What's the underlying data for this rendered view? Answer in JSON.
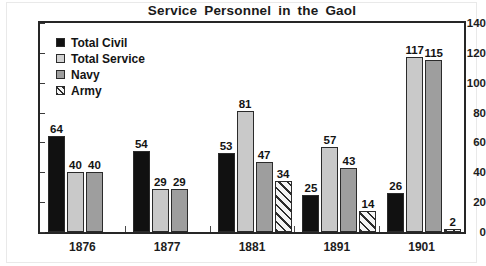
{
  "chart_data": {
    "type": "bar",
    "title": "Service Personnel in the Gaol",
    "xlabel": "",
    "ylabel": "",
    "categories": [
      "1876",
      "1877",
      "1881",
      "1891",
      "1901"
    ],
    "ylim": [
      0,
      140
    ],
    "yticks": [
      0,
      20,
      40,
      60,
      80,
      100,
      120,
      140
    ],
    "grid": false,
    "legend_position": "top-left inside plot",
    "series": [
      {
        "name": "Total Civil",
        "color": "#111111",
        "pattern": "solid",
        "values": [
          64,
          54,
          53,
          25,
          26
        ]
      },
      {
        "name": "Total Service",
        "color": "#c9c9c9",
        "pattern": "solid",
        "values": [
          40,
          29,
          81,
          57,
          117
        ]
      },
      {
        "name": "Navy",
        "color": "#9e9e9e",
        "pattern": "solid",
        "values": [
          40,
          29,
          47,
          43,
          115
        ]
      },
      {
        "name": "Army",
        "color": "#f4f4f4",
        "pattern": "diagonal-hatch",
        "values": [
          null,
          null,
          34,
          14,
          2
        ]
      }
    ],
    "data_labels": {
      "1876": {
        "Total Civil": "64",
        "Total Service": "40",
        "Navy": "40",
        "Army": ""
      },
      "1877": {
        "Total Civil": "54",
        "Total Service": "29",
        "Navy": "29",
        "Army": ""
      },
      "1881": {
        "Total Civil": "53",
        "Total Service": "81",
        "Navy": "47",
        "Army": "34"
      },
      "1891": {
        "Total Civil": "25",
        "Total Service": "57",
        "Navy": "43",
        "Army": "14"
      },
      "1901": {
        "Total Civil": "26",
        "Total Service": "117",
        "Navy": "115",
        "Army": "2"
      }
    }
  }
}
